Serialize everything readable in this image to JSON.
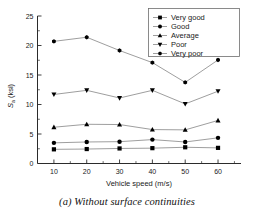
{
  "figure": {
    "caption": "(a) Without surface continuities"
  },
  "chart_data": {
    "type": "line",
    "title": "",
    "subtitle": "",
    "xlabel": "Vehicle speed (m/s)",
    "ylabel": "S a  (ksi)",
    "ylabel_main": "S",
    "ylabel_sub": "a",
    "ylabel_unit": "(ksi)",
    "x": [
      10,
      20,
      30,
      40,
      50,
      60
    ],
    "xticklabels": [
      "10",
      "20",
      "30",
      "40",
      "50",
      "60"
    ],
    "yticklabels": [
      "0",
      "5",
      "10",
      "15",
      "20",
      "25"
    ],
    "yticks": [
      0,
      5,
      10,
      15,
      20,
      25
    ],
    "xlim": [
      5,
      67
    ],
    "ylim": [
      0,
      25
    ],
    "grid": false,
    "minor_ticks": true,
    "legend_position": "top-right",
    "series": [
      {
        "name": "Very good",
        "marker": "square",
        "values": [
          2.4,
          2.45,
          2.55,
          2.6,
          2.75,
          2.65
        ]
      },
      {
        "name": "Good",
        "marker": "circle",
        "values": [
          3.5,
          3.65,
          3.7,
          4.05,
          3.65,
          4.35
        ]
      },
      {
        "name": "Average",
        "marker": "triangle-up",
        "values": [
          6.15,
          6.65,
          6.6,
          5.75,
          5.7,
          7.3
        ]
      },
      {
        "name": "Poor",
        "marker": "triangle-down",
        "values": [
          11.7,
          12.4,
          11.1,
          12.4,
          10.1,
          12.25
        ]
      },
      {
        "name": "Very poor",
        "marker": "hexagon",
        "values": [
          20.7,
          21.4,
          19.15,
          17.1,
          13.75,
          17.55
        ]
      }
    ]
  }
}
